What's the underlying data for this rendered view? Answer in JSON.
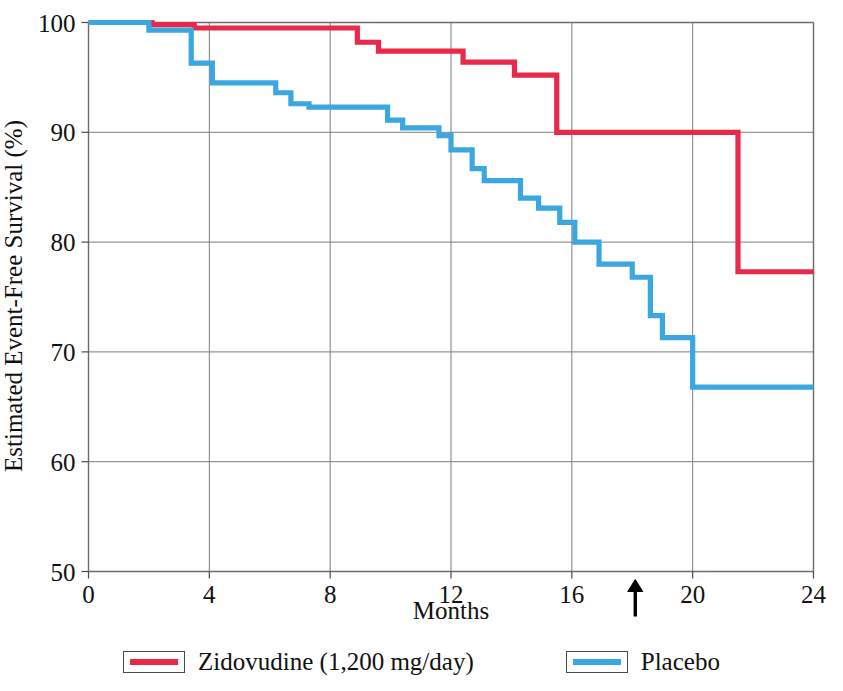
{
  "chart_data": {
    "type": "line",
    "subtype": "kaplan-meier-step",
    "title": "",
    "xlabel": "Months",
    "ylabel": "Estimated Event-Free Survival (%)",
    "xlim": [
      0,
      24
    ],
    "ylim": [
      50,
      100
    ],
    "xticks": [
      0,
      4,
      8,
      12,
      16,
      20,
      24
    ],
    "yticks": [
      50,
      60,
      70,
      80,
      90,
      100
    ],
    "xtick_labels": [
      "0",
      "4",
      "8",
      "12",
      "16",
      "20",
      "24"
    ],
    "ytick_labels": [
      "50",
      "60",
      "70",
      "80",
      "90",
      "100"
    ],
    "grid": "both",
    "legend_position": "bottom",
    "annotations": [
      {
        "name": "median-followup-arrow",
        "type": "arrow-up",
        "x": 18.1,
        "label": ""
      }
    ],
    "series": [
      {
        "name": "Zidovudine (1,200 mg/day)",
        "color": "#e8294a",
        "steps": [
          [
            0.0,
            100.0
          ],
          [
            2.1,
            100.0
          ],
          [
            2.1,
            99.8
          ],
          [
            3.5,
            99.8
          ],
          [
            3.5,
            99.5
          ],
          [
            8.9,
            99.5
          ],
          [
            8.9,
            98.2
          ],
          [
            9.6,
            98.2
          ],
          [
            9.6,
            97.4
          ],
          [
            12.4,
            97.4
          ],
          [
            12.4,
            96.4
          ],
          [
            14.1,
            96.4
          ],
          [
            14.1,
            95.2
          ],
          [
            15.5,
            95.2
          ],
          [
            15.5,
            90.0
          ],
          [
            21.5,
            90.0
          ],
          [
            21.5,
            77.3
          ],
          [
            24.0,
            77.3
          ]
        ]
      },
      {
        "name": "Placebo",
        "color": "#3aa7e0",
        "steps": [
          [
            0.0,
            100.0
          ],
          [
            2.0,
            100.0
          ],
          [
            2.0,
            99.3
          ],
          [
            3.4,
            99.3
          ],
          [
            3.4,
            96.3
          ],
          [
            4.1,
            96.3
          ],
          [
            4.1,
            94.5
          ],
          [
            6.2,
            94.5
          ],
          [
            6.2,
            93.6
          ],
          [
            6.7,
            93.6
          ],
          [
            6.7,
            92.6
          ],
          [
            7.3,
            92.6
          ],
          [
            7.3,
            92.3
          ],
          [
            9.9,
            92.3
          ],
          [
            9.9,
            91.1
          ],
          [
            10.4,
            91.1
          ],
          [
            10.4,
            90.4
          ],
          [
            11.6,
            90.4
          ],
          [
            11.6,
            89.7
          ],
          [
            12.0,
            89.7
          ],
          [
            12.0,
            88.4
          ],
          [
            12.7,
            88.4
          ],
          [
            12.7,
            86.7
          ],
          [
            13.1,
            86.7
          ],
          [
            13.1,
            85.6
          ],
          [
            14.3,
            85.6
          ],
          [
            14.3,
            84.0
          ],
          [
            14.9,
            84.0
          ],
          [
            14.9,
            83.1
          ],
          [
            15.6,
            83.1
          ],
          [
            15.6,
            81.8
          ],
          [
            16.1,
            81.8
          ],
          [
            16.1,
            80.0
          ],
          [
            16.9,
            80.0
          ],
          [
            16.9,
            78.0
          ],
          [
            18.0,
            78.0
          ],
          [
            18.0,
            76.8
          ],
          [
            18.6,
            76.8
          ],
          [
            18.6,
            73.3
          ],
          [
            19.0,
            73.3
          ],
          [
            19.0,
            71.3
          ],
          [
            20.0,
            71.3
          ],
          [
            20.0,
            66.8
          ],
          [
            24.0,
            66.8
          ]
        ]
      }
    ],
    "legend": [
      {
        "label": "Zidovudine (1,200 mg/day)",
        "color": "#e8294a"
      },
      {
        "label": "Placebo",
        "color": "#3aa7e0"
      }
    ]
  },
  "colors": {
    "zidovudine": "#e8294a",
    "placebo": "#3aa7e0",
    "axis": "#6b6b6b",
    "grid": "#7d7d7d",
    "text": "#111111",
    "background": "#ffffff"
  }
}
